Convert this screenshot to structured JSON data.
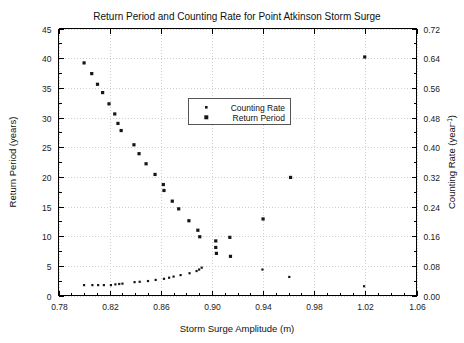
{
  "chart_data": {
    "type": "scatter",
    "title": "Return Period and Counting Rate for Point Atkinson Storm Surge",
    "xlabel": "Storm Surge Amplitude (m)",
    "ylabel": "Return Period (years)",
    "y2label_text": "Counting Rate (year",
    "y2label_sup": "-1",
    "y2label_tail": ")",
    "xlim": [
      0.78,
      1.06
    ],
    "ylim": [
      0,
      45
    ],
    "y2lim": [
      0.0,
      0.72
    ],
    "xticks": [
      "0.78",
      "0.82",
      "0.86",
      "0.90",
      "0.94",
      "0.98",
      "1.02",
      "1.06"
    ],
    "xtick_values": [
      0.78,
      0.82,
      0.86,
      0.9,
      0.94,
      0.98,
      1.02,
      1.06
    ],
    "yticks": [
      "0",
      "5",
      "10",
      "15",
      "20",
      "25",
      "30",
      "35",
      "40",
      "45"
    ],
    "ytick_values": [
      0,
      5,
      10,
      15,
      20,
      25,
      30,
      35,
      40,
      45
    ],
    "y2ticks": [
      "0.00",
      "0.08",
      "0.16",
      "0.24",
      "0.32",
      "0.40",
      "0.48",
      "0.56",
      "0.64",
      "0.72"
    ],
    "y2tick_values": [
      0.0,
      0.08,
      0.16,
      0.24,
      0.32,
      0.4,
      0.48,
      0.56,
      0.64,
      0.72
    ],
    "grid": true,
    "legend_position": "upper-center",
    "series": [
      {
        "name": "Return Period",
        "axis": "left",
        "marker": "square",
        "marker_size": 3.2,
        "color": "#161616",
        "points": [
          {
            "x": 0.8,
            "y": 39.2
          },
          {
            "x": 0.806,
            "y": 37.4
          },
          {
            "x": 0.8105,
            "y": 35.6
          },
          {
            "x": 0.8145,
            "y": 34.2
          },
          {
            "x": 0.8195,
            "y": 32.3
          },
          {
            "x": 0.824,
            "y": 30.6
          },
          {
            "x": 0.8265,
            "y": 29.0
          },
          {
            "x": 0.829,
            "y": 27.8
          },
          {
            "x": 0.839,
            "y": 25.4
          },
          {
            "x": 0.843,
            "y": 23.9
          },
          {
            "x": 0.8485,
            "y": 22.2
          },
          {
            "x": 0.8555,
            "y": 20.4
          },
          {
            "x": 0.862,
            "y": 18.7
          },
          {
            "x": 0.8625,
            "y": 17.7
          },
          {
            "x": 0.869,
            "y": 15.9
          },
          {
            "x": 0.874,
            "y": 14.6
          },
          {
            "x": 0.882,
            "y": 12.6
          },
          {
            "x": 0.889,
            "y": 11.0
          },
          {
            "x": 0.8905,
            "y": 9.9
          },
          {
            "x": 0.903,
            "y": 9.2
          },
          {
            "x": 0.903,
            "y": 8.1
          },
          {
            "x": 0.9035,
            "y": 7.1
          },
          {
            "x": 0.914,
            "y": 9.8
          },
          {
            "x": 0.9145,
            "y": 6.6
          },
          {
            "x": 0.94,
            "y": 12.9
          },
          {
            "x": 0.9615,
            "y": 19.9
          },
          {
            "x": 1.0195,
            "y": 40.2
          }
        ]
      },
      {
        "name": "Counting Rate",
        "axis": "right",
        "marker": "square",
        "marker_size": 2.2,
        "color": "#161616",
        "points": [
          {
            "x": 0.8,
            "y": 0.028
          },
          {
            "x": 0.8065,
            "y": 0.028
          },
          {
            "x": 0.811,
            "y": 0.028
          },
          {
            "x": 0.8155,
            "y": 0.028
          },
          {
            "x": 0.821,
            "y": 0.028
          },
          {
            "x": 0.8245,
            "y": 0.03
          },
          {
            "x": 0.8275,
            "y": 0.031
          },
          {
            "x": 0.83,
            "y": 0.032
          },
          {
            "x": 0.8395,
            "y": 0.036
          },
          {
            "x": 0.8435,
            "y": 0.037
          },
          {
            "x": 0.85,
            "y": 0.039
          },
          {
            "x": 0.856,
            "y": 0.042
          },
          {
            "x": 0.8625,
            "y": 0.045
          },
          {
            "x": 0.8665,
            "y": 0.048
          },
          {
            "x": 0.87,
            "y": 0.051
          },
          {
            "x": 0.8755,
            "y": 0.055
          },
          {
            "x": 0.8825,
            "y": 0.06
          },
          {
            "x": 0.888,
            "y": 0.066
          },
          {
            "x": 0.89,
            "y": 0.07
          },
          {
            "x": 0.892,
            "y": 0.075
          },
          {
            "x": 0.9395,
            "y": 0.07
          },
          {
            "x": 0.9605,
            "y": 0.05
          },
          {
            "x": 1.019,
            "y": 0.025
          }
        ]
      }
    ]
  },
  "legend": {
    "entries": [
      {
        "label": "Counting Rate",
        "marker": "small-square"
      },
      {
        "label": "Return Period",
        "marker": "large-square"
      }
    ]
  },
  "colors": {
    "marker": "#161616",
    "grid": "#cfcfcf",
    "axis": "#000000",
    "background": "#ffffff"
  }
}
